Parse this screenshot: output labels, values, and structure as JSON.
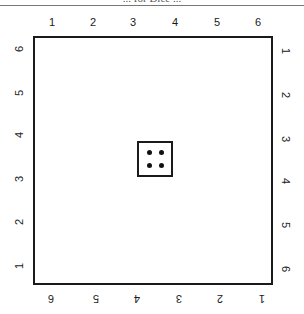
{
  "header": {
    "title_fragment": "... for Dice ..."
  },
  "board": {
    "top_labels": [
      "1",
      "2",
      "3",
      "4",
      "5",
      "6"
    ],
    "bottom_labels": [
      "6",
      "5",
      "4",
      "3",
      "2",
      "1"
    ],
    "left_labels": [
      "6",
      "5",
      "4",
      "3",
      "2",
      "1"
    ],
    "right_labels": [
      "1",
      "2",
      "3",
      "4",
      "5",
      "6"
    ]
  },
  "die": {
    "face_value": 4,
    "pips": 4
  }
}
